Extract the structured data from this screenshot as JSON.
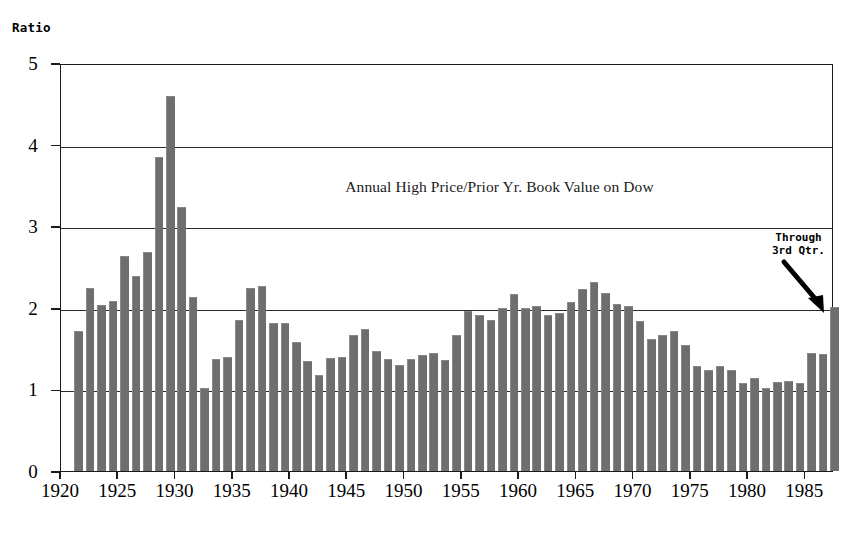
{
  "axis": {
    "y_caption": "Ratio",
    "y_ticks": [
      "5",
      "4",
      "3",
      "2",
      "1",
      "0"
    ],
    "x_ticks": [
      "1920",
      "1925",
      "1930",
      "1935",
      "1940",
      "1945",
      "1950",
      "1955",
      "1960",
      "1965",
      "1970",
      "1975",
      "1980",
      "1985"
    ]
  },
  "title": "Annual High Price/Prior Yr. Book Value on Dow",
  "annotation": {
    "line1": "Through",
    "line2": "3rd Qtr.",
    "icon": "down-right-arrow-icon"
  },
  "colors": {
    "bar": "#6e6e6e",
    "axis": "#1a1a1a",
    "grid": "#2a2a2a",
    "background": "#ffffff"
  },
  "chart_data": {
    "type": "bar",
    "title": "Annual High Price/Prior Yr. Book Value on Dow",
    "xlabel": "",
    "ylabel": "Ratio",
    "ylim": [
      0,
      5
    ],
    "xlim": [
      1920,
      1987.5
    ],
    "grid": true,
    "gridlines_y": [
      1,
      2,
      3,
      4
    ],
    "legend": "none",
    "ytick_values": [
      0,
      1,
      2,
      3,
      4,
      5
    ],
    "xtick_values": [
      1920,
      1925,
      1930,
      1935,
      1940,
      1945,
      1950,
      1955,
      1960,
      1965,
      1970,
      1975,
      1980,
      1985
    ],
    "annotations": [
      {
        "text": "Through 3rd Qtr.",
        "points_to_year": 1987,
        "points_to_value": 2.0
      }
    ],
    "categories": [
      1921,
      1922,
      1923,
      1924,
      1925,
      1926,
      1927,
      1928,
      1929,
      1930,
      1931,
      1932,
      1933,
      1934,
      1935,
      1936,
      1937,
      1938,
      1939,
      1940,
      1941,
      1942,
      1943,
      1944,
      1945,
      1946,
      1947,
      1948,
      1949,
      1950,
      1951,
      1952,
      1953,
      1954,
      1955,
      1956,
      1957,
      1958,
      1959,
      1960,
      1961,
      1962,
      1963,
      1964,
      1965,
      1966,
      1967,
      1968,
      1969,
      1970,
      1971,
      1972,
      1973,
      1974,
      1975,
      1976,
      1977,
      1978,
      1979,
      1980,
      1981,
      1982,
      1983,
      1984,
      1985,
      1986,
      1987
    ],
    "values": [
      1.7,
      2.23,
      2.02,
      2.07,
      2.62,
      2.38,
      2.67,
      3.84,
      4.58,
      3.22,
      2.12,
      1.01,
      1.36,
      1.39,
      1.84,
      2.23,
      2.26,
      1.8,
      1.8,
      1.57,
      1.33,
      1.16,
      1.37,
      1.39,
      1.65,
      1.73,
      1.46,
      1.36,
      1.29,
      1.36,
      1.41,
      1.43,
      1.35,
      1.65,
      1.95,
      1.9,
      1.84,
      1.99,
      2.16,
      1.98,
      2.01,
      1.9,
      1.93,
      2.06,
      2.22,
      2.3,
      2.17,
      2.03,
      2.01,
      1.83,
      1.6,
      1.66,
      1.7,
      1.53,
      1.27,
      1.23,
      1.27,
      1.22,
      1.07,
      1.13,
      1.0,
      1.08,
      1.09,
      1.07,
      1.44,
      1.42,
      2.0
    ],
    "series": [
      {
        "name": "Annual High Price / Prior Yr. Book Value",
        "values": [
          1.7,
          2.23,
          2.02,
          2.07,
          2.62,
          2.38,
          2.67,
          3.84,
          4.58,
          3.22,
          2.12,
          1.01,
          1.36,
          1.39,
          1.84,
          2.23,
          2.26,
          1.8,
          1.8,
          1.57,
          1.33,
          1.16,
          1.37,
          1.39,
          1.65,
          1.73,
          1.46,
          1.36,
          1.29,
          1.36,
          1.41,
          1.43,
          1.35,
          1.65,
          1.95,
          1.9,
          1.84,
          1.99,
          2.16,
          1.98,
          2.01,
          1.9,
          1.93,
          2.06,
          2.22,
          2.3,
          2.17,
          2.03,
          2.01,
          1.83,
          1.6,
          1.66,
          1.7,
          1.53,
          1.27,
          1.23,
          1.27,
          1.22,
          1.07,
          1.13,
          1.0,
          1.08,
          1.09,
          1.07,
          1.44,
          1.42,
          2.0
        ]
      }
    ]
  }
}
